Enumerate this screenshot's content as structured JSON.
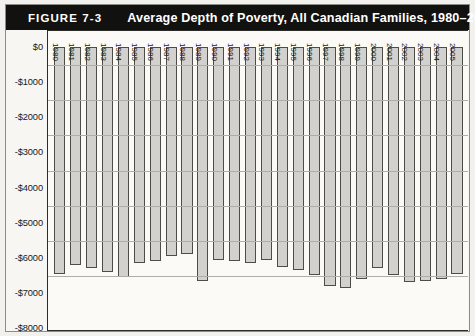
{
  "figure": {
    "number": "FIGURE 7-3",
    "title": "Average Depth of Poverty, All Canadian Families, 1980–2005"
  },
  "colors": {
    "header_bg": "#111110",
    "header_text": "#ffffff",
    "bar_fill": "#d2d1cd",
    "bar_stroke": "#4d4d48",
    "axis": "#2b2b28",
    "gridline": "#aeaea8",
    "page_bg": "#f2f1ee"
  },
  "axis": {
    "y_ticks": [
      "$0",
      "-$1000",
      "-$2000",
      "-$3000",
      "-$4000",
      "-$5000",
      "-$6000",
      "-$7000",
      "-$8000"
    ],
    "y_tick_values": [
      0,
      -1000,
      -2000,
      -3000,
      -4000,
      -5000,
      -6000,
      -7000,
      -8000
    ],
    "y_min": -8000,
    "y_max": 0,
    "y_step": 1000,
    "x_label": "",
    "y_label": ""
  },
  "chart_data": {
    "type": "bar",
    "title": "Average Depth of Poverty, All Canadian Families, 1980–2005",
    "xlabel": "",
    "ylabel": "",
    "ylim": [
      -8000,
      0
    ],
    "grid": true,
    "legend": "none",
    "orientation": "downward",
    "categories": [
      "1980",
      "1981",
      "1982",
      "1983",
      "1984",
      "1985",
      "1986",
      "1987",
      "1988",
      "1989",
      "1990",
      "1991",
      "1992",
      "1993",
      "1994",
      "1995",
      "1996",
      "1997",
      "1998",
      "1999",
      "2000",
      "2001",
      "2002",
      "2003",
      "2004",
      "2005"
    ],
    "values": [
      -6450,
      -6200,
      -6300,
      -6400,
      -6550,
      -6150,
      -6100,
      -5950,
      -5900,
      -6650,
      -6050,
      -6100,
      -6150,
      -6050,
      -6250,
      -6350,
      -6500,
      -6800,
      -6850,
      -6600,
      -6300,
      -6500,
      -6700,
      -6650,
      -6600,
      -6450
    ]
  }
}
